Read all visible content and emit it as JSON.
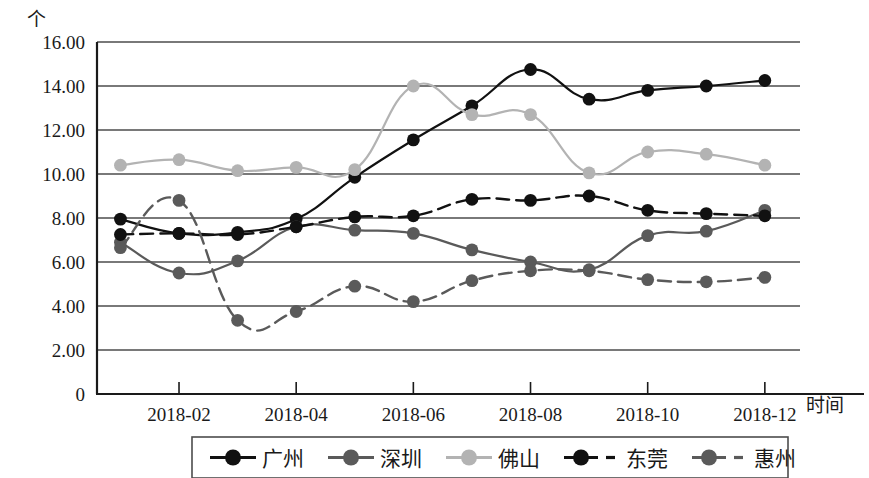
{
  "chart_data": {
    "type": "line",
    "title": "",
    "xlabel": "时间",
    "ylabel": "个",
    "ylim": [
      0,
      16
    ],
    "grid": true,
    "legend_position": "bottom",
    "x": [
      1,
      2,
      3,
      4,
      5,
      6,
      7,
      8,
      9,
      10,
      11,
      12
    ],
    "categories": [
      "2018-01",
      "2018-02",
      "2018-03",
      "2018-04",
      "2018-05",
      "2018-06",
      "2018-07",
      "2018-08",
      "2018-09",
      "2018-10",
      "2018-11",
      "2018-12"
    ],
    "xtick_labels": [
      "2018-02",
      "2018-04",
      "2018-06",
      "2018-08",
      "2018-10",
      "2018-12"
    ],
    "xtick_values": [
      2,
      4,
      6,
      8,
      10,
      12
    ],
    "ytick_labels": [
      "0",
      "2.00",
      "4.00",
      "6.00",
      "8.00",
      "10.00",
      "12.00",
      "14.00",
      "16.00"
    ],
    "ytick_values": [
      0,
      2,
      4,
      6,
      8,
      10,
      12,
      14,
      16
    ],
    "series": [
      {
        "name": "广州",
        "color": "#111111",
        "style": "solid",
        "values": [
          7.95,
          7.3,
          7.35,
          7.95,
          9.85,
          11.55,
          13.1,
          14.75,
          13.4,
          13.8,
          14.0,
          14.25
        ]
      },
      {
        "name": "深圳",
        "color": "#5a5a5a",
        "style": "solid",
        "values": [
          6.9,
          5.5,
          6.05,
          7.6,
          7.45,
          7.3,
          6.55,
          6.0,
          5.65,
          7.2,
          7.4,
          8.35
        ]
      },
      {
        "name": "佛山",
        "color": "#b3b3b3",
        "style": "solid",
        "values": [
          10.4,
          10.65,
          10.15,
          10.3,
          10.2,
          14.0,
          12.7,
          12.7,
          10.05,
          11.0,
          10.9,
          10.4
        ]
      },
      {
        "name": "东莞",
        "color": "#111111",
        "style": "dashed",
        "values": [
          7.25,
          7.3,
          7.25,
          7.6,
          8.05,
          8.1,
          8.85,
          8.8,
          9.0,
          8.35,
          8.2,
          8.1
        ]
      },
      {
        "name": "惠州",
        "color": "#5a5a5a",
        "style": "dashed",
        "values": [
          6.65,
          8.8,
          3.35,
          3.75,
          4.9,
          4.2,
          5.15,
          5.6,
          5.6,
          5.2,
          5.1,
          5.3
        ]
      }
    ]
  },
  "axis": {
    "y_unit_label": "个",
    "x_axis_label": "时间"
  },
  "legend": {
    "items": [
      {
        "label": "广州",
        "color": "#111111",
        "style": "solid"
      },
      {
        "label": "深圳",
        "color": "#5a5a5a",
        "style": "solid"
      },
      {
        "label": "佛山",
        "color": "#b3b3b3",
        "style": "solid"
      },
      {
        "label": "东莞",
        "color": "#111111",
        "style": "dashed"
      },
      {
        "label": "惠州",
        "color": "#5a5a5a",
        "style": "dashed"
      }
    ]
  }
}
